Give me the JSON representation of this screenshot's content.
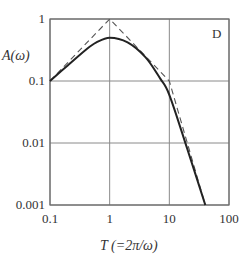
{
  "chart_data": {
    "type": "line",
    "title": "",
    "panel_label": "D",
    "xlabel": "T (=2π/ω)",
    "ylabel": "A(ω)",
    "xscale": "log",
    "yscale": "log",
    "xlim": [
      0.1,
      100
    ],
    "ylim": [
      0.001,
      1
    ],
    "xticks": [
      "0.1",
      "1",
      "10",
      "100"
    ],
    "yticks": [
      "1",
      "0.1",
      "0.01",
      "0.001"
    ],
    "grid": true,
    "legend": null,
    "series": [
      {
        "name": "asymptote (dashed)",
        "style": "dashed",
        "x": [
          0.1,
          1,
          10,
          40
        ],
        "y": [
          0.1,
          1,
          0.1,
          0.001
        ]
      },
      {
        "name": "response (solid)",
        "style": "solid",
        "x": [
          0.1,
          0.2,
          0.4,
          0.6,
          1,
          2,
          4,
          7,
          10,
          20,
          40
        ],
        "y": [
          0.1,
          0.18,
          0.32,
          0.42,
          0.5,
          0.42,
          0.24,
          0.11,
          0.06,
          0.008,
          0.001
        ]
      }
    ]
  }
}
